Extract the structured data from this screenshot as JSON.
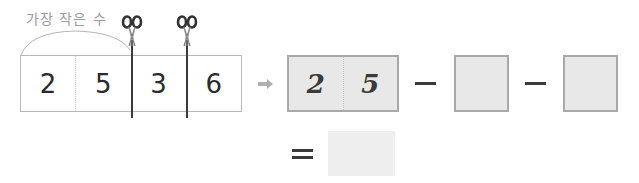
{
  "annotation": {
    "label": "가장 작은 수"
  },
  "strip": {
    "digits": [
      "2",
      "5",
      "3",
      "6"
    ],
    "cut_positions_after_cell": [
      2,
      3
    ]
  },
  "answer": {
    "digits": [
      "2",
      "5"
    ]
  },
  "expression": {
    "operator_1": "−",
    "operator_2": "−",
    "equals": "=",
    "blank_1": "",
    "blank_2": "",
    "result": ""
  },
  "icons": {
    "scissors": "scissors-icon",
    "arrow": "arrow-right-icon"
  },
  "colors": {
    "box_fill": "#e8e8e8",
    "box_border": "#a9a9a9",
    "ink": "#2b2b2b",
    "label_gray": "#9a9a9a"
  }
}
